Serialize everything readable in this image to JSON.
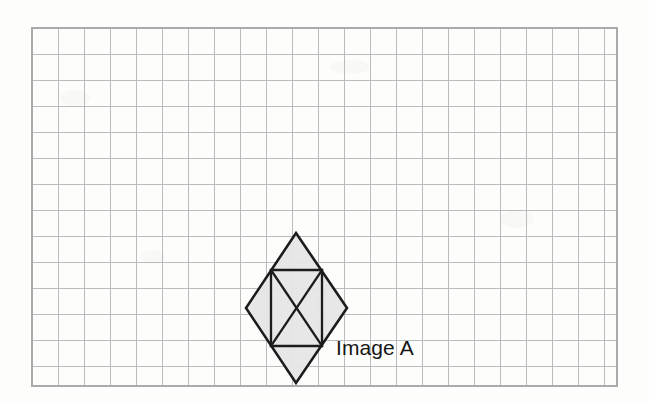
{
  "page": {
    "width": 649,
    "height": 404,
    "background_color": "#fdfdfc",
    "kind": "graph-paper-worksheet"
  },
  "grid": {
    "x": 32,
    "y": 28,
    "width": 585,
    "height": 358,
    "cell_size": 26,
    "columns": 22,
    "rows": 14,
    "line_color": "#b9bcbd",
    "border_color": "#a7abac"
  },
  "figure": {
    "label": "Image A",
    "label_x": 336,
    "label_y": 337,
    "name": "rhombus-with-inscribed-rectangle",
    "fill_color": "#e6e6e6",
    "stroke_color": "#1c1c1c",
    "outline_points": "296,233 347,308 296,383 246,308",
    "vertices": {
      "top": [
        296,
        233
      ],
      "right": [
        347,
        308
      ],
      "bottom": [
        296,
        383
      ],
      "left": [
        246,
        308
      ]
    },
    "inner_rectangle": {
      "left": 271,
      "top": 270,
      "right": 322,
      "bottom": 346,
      "points": "271,270 322,270 322,346 271,346"
    },
    "diagonals": [
      {
        "from": [
          271,
          270
        ],
        "to": [
          322,
          346
        ]
      },
      {
        "from": [
          322,
          270
        ],
        "to": [
          271,
          346
        ]
      }
    ],
    "center": [
      296,
      308
    ]
  }
}
